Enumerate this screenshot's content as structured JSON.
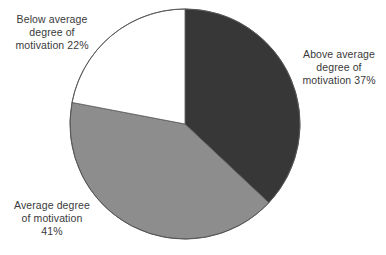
{
  "chart_data": {
    "type": "pie",
    "title": "",
    "categories": [
      "Above average degree of motivation",
      "Average degree of motivation",
      "Below average degree of motivation"
    ],
    "values": [
      37,
      41,
      22
    ],
    "unit": "%",
    "legend_position": "none",
    "grid": false,
    "start_angle_deg": 0,
    "direction": "clockwise",
    "slices": [
      {
        "name": "above-average",
        "label": "Above average\ndegree of\nmotivation 37%",
        "value": 37,
        "color": "#373737",
        "start_deg": 0,
        "end_deg": 133.2
      },
      {
        "name": "average",
        "label": "Average degree\nof motivation\n41%",
        "value": 41,
        "color": "#8d8d8d",
        "start_deg": 133.2,
        "end_deg": 280.8
      },
      {
        "name": "below-average",
        "label": "Below average\ndegree of\nmotivation 22%",
        "value": 22,
        "color": "#ffffff",
        "start_deg": 280.8,
        "end_deg": 360
      }
    ],
    "geometry": {
      "center_x": 185,
      "center_y": 124,
      "radius": 115
    },
    "outline_color": "#555555",
    "background_color": "#ffffff",
    "text_color": "#3a3a3a"
  },
  "labels": {
    "above_average": "Above average\ndegree of\nmotivation 37%",
    "average": "Average degree\nof motivation\n41%",
    "below_average": "Below average\ndegree of\nmotivation 22%"
  }
}
